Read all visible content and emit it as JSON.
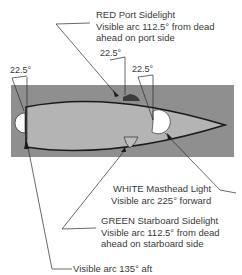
{
  "diagram": {
    "colors": {
      "water": "#8f8f8f",
      "hull": "#b4b4b4",
      "hull_outline": "#1a1a1a",
      "red_light": "#3c3c3c",
      "green_light": "#bdbdbd",
      "white_light": "#ffffff"
    },
    "angles": {
      "stern_left": "22.5°",
      "port_top": "22.5°",
      "masthead": "22.5°"
    },
    "labels": {
      "red": {
        "line1": "RED Port Sidelight",
        "line2": "Visible arc 112.5° from dead",
        "line3": "ahead on port side"
      },
      "white": {
        "line1": "WHITE Masthead Light",
        "line2": "Visible arc 225° forward"
      },
      "green": {
        "line1": "GREEN Starboard Sidelight",
        "line2": "Visible arc 112.5° from dead",
        "line3": "ahead on starboard side"
      },
      "stern": {
        "line1": "Visible arc 135° aft"
      }
    }
  }
}
